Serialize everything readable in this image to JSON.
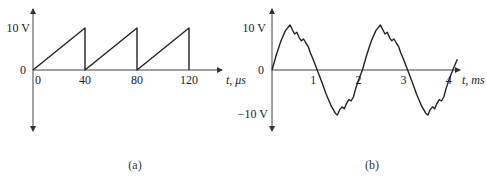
{
  "chart_data": [
    {
      "id": "a",
      "type": "line",
      "title": "",
      "caption": "(a)",
      "xlabel": "t, μs",
      "ylabel": "",
      "x_ticks": [
        "0",
        "40",
        "80",
        "120"
      ],
      "y_ticks": [
        "10 V",
        "0"
      ],
      "xlim": [
        0,
        130
      ],
      "ylim": [
        -12,
        14
      ],
      "grid": false,
      "waveform": "sawtooth",
      "x": [
        0,
        40,
        40,
        80,
        80,
        120,
        120
      ],
      "y": [
        0,
        10,
        0,
        10,
        0,
        10,
        0
      ]
    },
    {
      "id": "b",
      "type": "line",
      "title": "",
      "caption": "(b)",
      "xlabel": "t, ms",
      "ylabel": "",
      "x_ticks": [
        "1",
        "2",
        "3",
        "4"
      ],
      "y_ticks": [
        "10 V",
        "0",
        "−10 V"
      ],
      "xlim": [
        0,
        4.15
      ],
      "ylim": [
        -14,
        14
      ],
      "grid": false,
      "waveform": "sine with ripple",
      "period_ms": 2,
      "amplitude_v": 10,
      "x": [
        0,
        0.1,
        0.2,
        0.3,
        0.4,
        0.45,
        0.5,
        0.55,
        0.6,
        0.65,
        0.7,
        0.75,
        0.8,
        0.85,
        0.9,
        1.0,
        1.1,
        1.2,
        1.3,
        1.4,
        1.45,
        1.5,
        1.55,
        1.6,
        1.65,
        1.7,
        1.75,
        1.8,
        1.85,
        1.9,
        2.0,
        2.1,
        2.2,
        2.3,
        2.4,
        2.45,
        2.5,
        2.55,
        2.6,
        2.65,
        2.7,
        2.75,
        2.8,
        2.85,
        2.9,
        3.0,
        3.1,
        3.2,
        3.3,
        3.4,
        3.45,
        3.5,
        3.55,
        3.6,
        3.65,
        3.7,
        3.75,
        3.8,
        3.85,
        3.9,
        4.0,
        4.1
      ],
      "y": [
        0,
        3.5,
        6.5,
        8.8,
        10.0,
        9.0,
        8.0,
        8.4,
        7.2,
        6.5,
        6.9,
        6.0,
        5.2,
        3.8,
        2.6,
        0,
        -2.6,
        -5.4,
        -7.8,
        -9.6,
        -10.0,
        -8.8,
        -8.2,
        -8.6,
        -7.4,
        -6.6,
        -6.9,
        -6.0,
        -4.2,
        -2.6,
        0,
        3.5,
        6.5,
        8.8,
        10.0,
        9.0,
        8.0,
        8.4,
        7.2,
        6.5,
        6.9,
        6.0,
        5.2,
        3.8,
        2.6,
        0,
        -2.6,
        -5.4,
        -7.8,
        -9.6,
        -10.0,
        -8.8,
        -8.2,
        -8.6,
        -7.4,
        -6.6,
        -6.9,
        -6.0,
        -4.2,
        -2.6,
        0,
        2.4
      ]
    }
  ]
}
